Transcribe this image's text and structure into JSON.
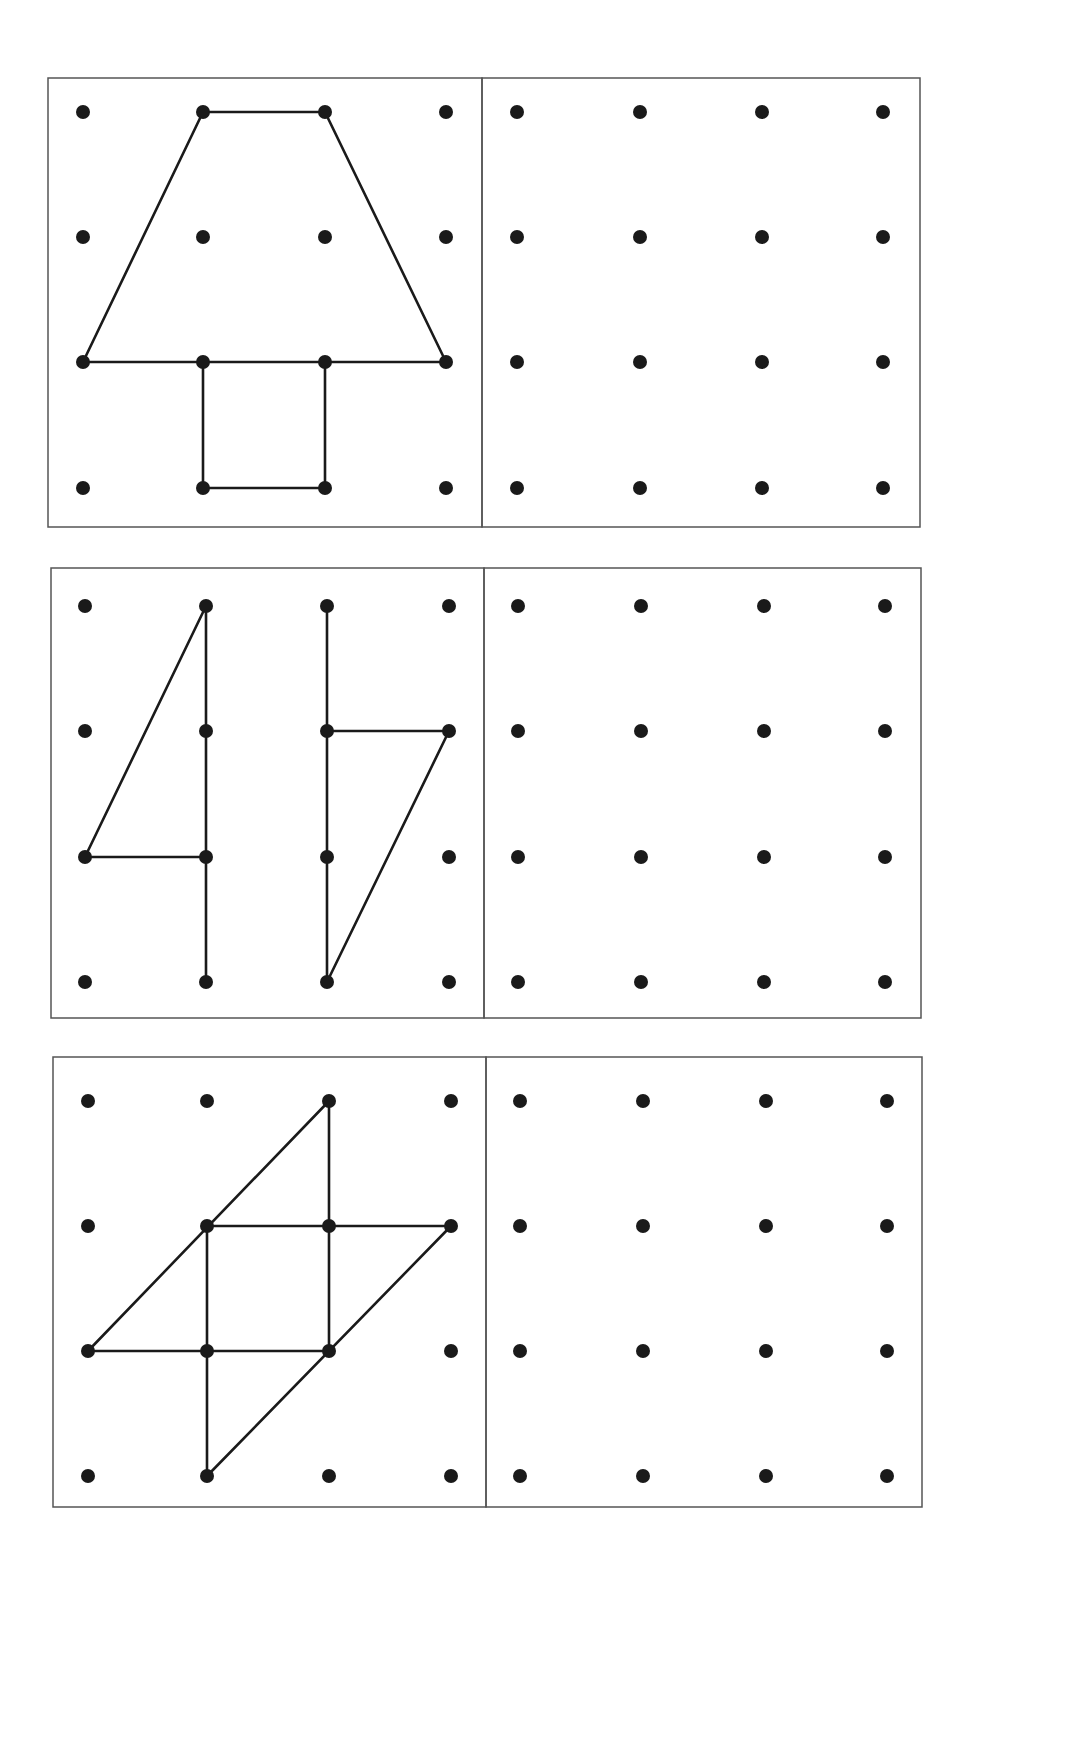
{
  "worksheet": {
    "type": "dot-grid mirror/copy exercise",
    "grid_size": [
      4,
      4
    ],
    "colors": {
      "ink": "#1a1a1a",
      "border": "#555555",
      "background": "#ffffff"
    },
    "rows": [
      {
        "box": {
          "x": 48,
          "y": 78,
          "w": 872,
          "h": 449,
          "divider_x": 482
        },
        "left_cols": [
          83,
          203,
          325,
          446
        ],
        "right_cols": [
          517,
          640,
          762,
          883
        ],
        "row_ys": [
          112,
          237,
          362,
          488
        ],
        "figure_name": "trapezoid-with-square",
        "segments": [
          [
            [
              1,
              0
            ],
            [
              2,
              0
            ]
          ],
          [
            [
              2,
              0
            ],
            [
              3,
              2
            ]
          ],
          [
            [
              3,
              2
            ],
            [
              0,
              2
            ]
          ],
          [
            [
              0,
              2
            ],
            [
              1,
              0
            ]
          ],
          [
            [
              1,
              2
            ],
            [
              1,
              3
            ]
          ],
          [
            [
              1,
              3
            ],
            [
              2,
              3
            ]
          ],
          [
            [
              2,
              3
            ],
            [
              2,
              2
            ]
          ]
        ]
      },
      {
        "box": {
          "x": 51,
          "y": 568,
          "w": 870,
          "h": 450,
          "divider_x": 484
        },
        "left_cols": [
          85,
          206,
          327,
          449
        ],
        "right_cols": [
          518,
          641,
          764,
          885
        ],
        "row_ys": [
          606,
          731,
          857,
          982
        ],
        "figure_name": "two-flags",
        "segments": [
          [
            [
              1,
              0
            ],
            [
              1,
              3
            ]
          ],
          [
            [
              1,
              0
            ],
            [
              0,
              2
            ]
          ],
          [
            [
              0,
              2
            ],
            [
              1,
              2
            ]
          ],
          [
            [
              2,
              0
            ],
            [
              2,
              3
            ]
          ],
          [
            [
              2,
              1
            ],
            [
              3,
              1
            ]
          ],
          [
            [
              3,
              1
            ],
            [
              2,
              3
            ]
          ]
        ]
      },
      {
        "box": {
          "x": 53,
          "y": 1057,
          "w": 869,
          "h": 450,
          "divider_x": 486
        },
        "left_cols": [
          88,
          207,
          329,
          451
        ],
        "right_cols": [
          520,
          643,
          766,
          887
        ],
        "row_ys": [
          1101,
          1226,
          1351,
          1476
        ],
        "figure_name": "pinwheel-parallelograms",
        "segments": [
          [
            [
              2,
              0
            ],
            [
              2,
              2
            ]
          ],
          [
            [
              1,
              1
            ],
            [
              3,
              1
            ]
          ],
          [
            [
              0,
              2
            ],
            [
              2,
              2
            ]
          ],
          [
            [
              1,
              1
            ],
            [
              1,
              3
            ]
          ],
          [
            [
              2,
              0
            ],
            [
              0,
              2
            ]
          ],
          [
            [
              3,
              1
            ],
            [
              1,
              3
            ]
          ]
        ]
      }
    ]
  }
}
